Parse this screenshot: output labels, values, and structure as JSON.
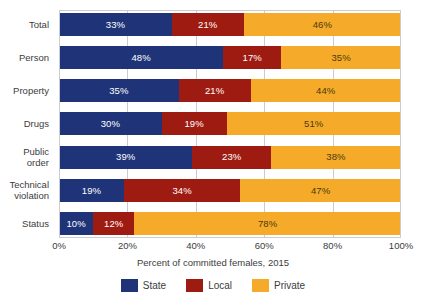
{
  "chart_data": {
    "type": "bar",
    "orientation": "horizontal",
    "stacked": true,
    "stacked_percent": true,
    "title": "",
    "xlabel": "Percent of committed females, 2015",
    "ylabel": "",
    "xlim": [
      0,
      100
    ],
    "xticks": [
      0,
      20,
      40,
      60,
      80,
      100
    ],
    "xtick_labels": [
      "0%",
      "20%",
      "40%",
      "60%",
      "80%",
      "100%"
    ],
    "grid": "vertical",
    "legend_position": "bottom-center",
    "categories": [
      "Total",
      "Person",
      "Property",
      "Drugs",
      "Public order",
      "Technical violation",
      "Status"
    ],
    "category_lines": [
      [
        "Total"
      ],
      [
        "Person"
      ],
      [
        "Property"
      ],
      [
        "Drugs"
      ],
      [
        "Public",
        "order"
      ],
      [
        "Technical",
        "violation"
      ],
      [
        "Status"
      ]
    ],
    "series": [
      {
        "name": "State",
        "color": "#1f3478",
        "values": [
          33,
          48,
          35,
          30,
          39,
          19,
          10
        ]
      },
      {
        "name": "Local",
        "color": "#9e1b12",
        "values": [
          21,
          17,
          21,
          19,
          23,
          34,
          12
        ]
      },
      {
        "name": "Private",
        "color": "#f5ab29",
        "values": [
          46,
          35,
          44,
          51,
          38,
          47,
          78
        ]
      }
    ],
    "data_labels": [
      [
        "33%",
        "21%",
        "46%"
      ],
      [
        "48%",
        "17%",
        "35%"
      ],
      [
        "35%",
        "21%",
        "44%"
      ],
      [
        "30%",
        "19%",
        "51%"
      ],
      [
        "39%",
        "23%",
        "38%"
      ],
      [
        "19%",
        "34%",
        "47%"
      ],
      [
        "10%",
        "12%",
        "78%"
      ]
    ]
  },
  "legend": {
    "items": [
      {
        "label": "State",
        "color": "#1f3478"
      },
      {
        "label": "Local",
        "color": "#9e1b12"
      },
      {
        "label": "Private",
        "color": "#f5ab29"
      }
    ]
  },
  "axis": {
    "x_title": "Percent of committed females, 2015"
  },
  "colors": {
    "state": "#1f3478",
    "local": "#9e1b12",
    "private": "#f5ab29",
    "grid": "#c9ccd4",
    "text": "#3c3c3c",
    "label_on_dark": "#ffffff",
    "label_on_private": "#4a3a10",
    "background": "#ffffff"
  }
}
